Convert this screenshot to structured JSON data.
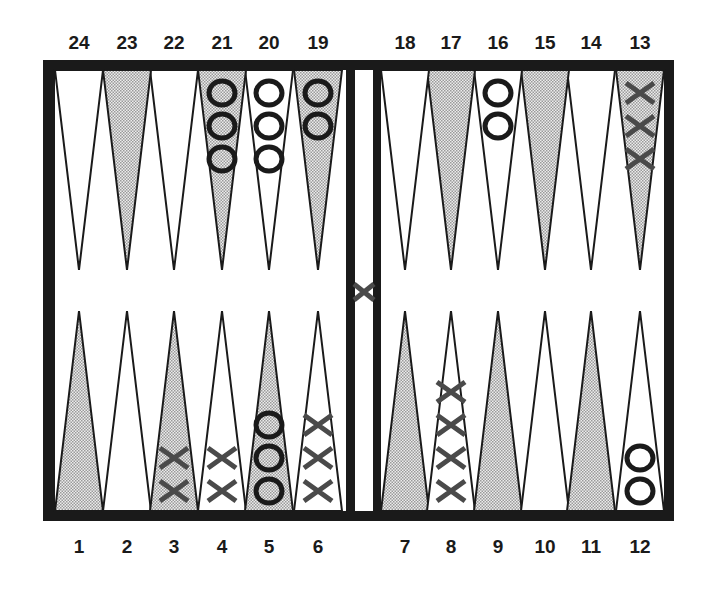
{
  "colors": {
    "frame": "#1a1a1a",
    "shaded_point": "#c8c8c8",
    "light_point": "#ffffff",
    "checker_o": "#1a1a1a",
    "checker_x": "#4a4a4a"
  },
  "top_labels": [
    "24",
    "23",
    "22",
    "21",
    "20",
    "19",
    "18",
    "17",
    "16",
    "15",
    "14",
    "13"
  ],
  "bottom_labels": [
    "1",
    "2",
    "3",
    "4",
    "5",
    "6",
    "7",
    "8",
    "9",
    "10",
    "11",
    "12"
  ],
  "points": [
    {
      "n": 1,
      "shaded": true,
      "player": null,
      "count": 0
    },
    {
      "n": 2,
      "shaded": false,
      "player": null,
      "count": 0
    },
    {
      "n": 3,
      "shaded": true,
      "player": "X",
      "count": 2
    },
    {
      "n": 4,
      "shaded": false,
      "player": "X",
      "count": 2
    },
    {
      "n": 5,
      "shaded": true,
      "player": "O",
      "count": 3
    },
    {
      "n": 6,
      "shaded": false,
      "player": "X",
      "count": 3
    },
    {
      "n": 7,
      "shaded": true,
      "player": null,
      "count": 0
    },
    {
      "n": 8,
      "shaded": false,
      "player": "X",
      "count": 4
    },
    {
      "n": 9,
      "shaded": true,
      "player": null,
      "count": 0
    },
    {
      "n": 10,
      "shaded": false,
      "player": null,
      "count": 0
    },
    {
      "n": 11,
      "shaded": true,
      "player": null,
      "count": 0
    },
    {
      "n": 12,
      "shaded": false,
      "player": "O",
      "count": 2
    },
    {
      "n": 13,
      "shaded": true,
      "player": "X",
      "count": 3
    },
    {
      "n": 14,
      "shaded": false,
      "player": null,
      "count": 0
    },
    {
      "n": 15,
      "shaded": true,
      "player": null,
      "count": 0
    },
    {
      "n": 16,
      "shaded": false,
      "player": "O",
      "count": 2
    },
    {
      "n": 17,
      "shaded": true,
      "player": null,
      "count": 0
    },
    {
      "n": 18,
      "shaded": false,
      "player": null,
      "count": 0
    },
    {
      "n": 19,
      "shaded": true,
      "player": "O",
      "count": 2
    },
    {
      "n": 20,
      "shaded": false,
      "player": "O",
      "count": 3
    },
    {
      "n": 21,
      "shaded": true,
      "player": "O",
      "count": 3
    },
    {
      "n": 22,
      "shaded": false,
      "player": null,
      "count": 0
    },
    {
      "n": 23,
      "shaded": true,
      "player": null,
      "count": 0
    },
    {
      "n": 24,
      "shaded": false,
      "player": null,
      "count": 0
    }
  ],
  "bar": {
    "player": "X",
    "count": 1
  }
}
